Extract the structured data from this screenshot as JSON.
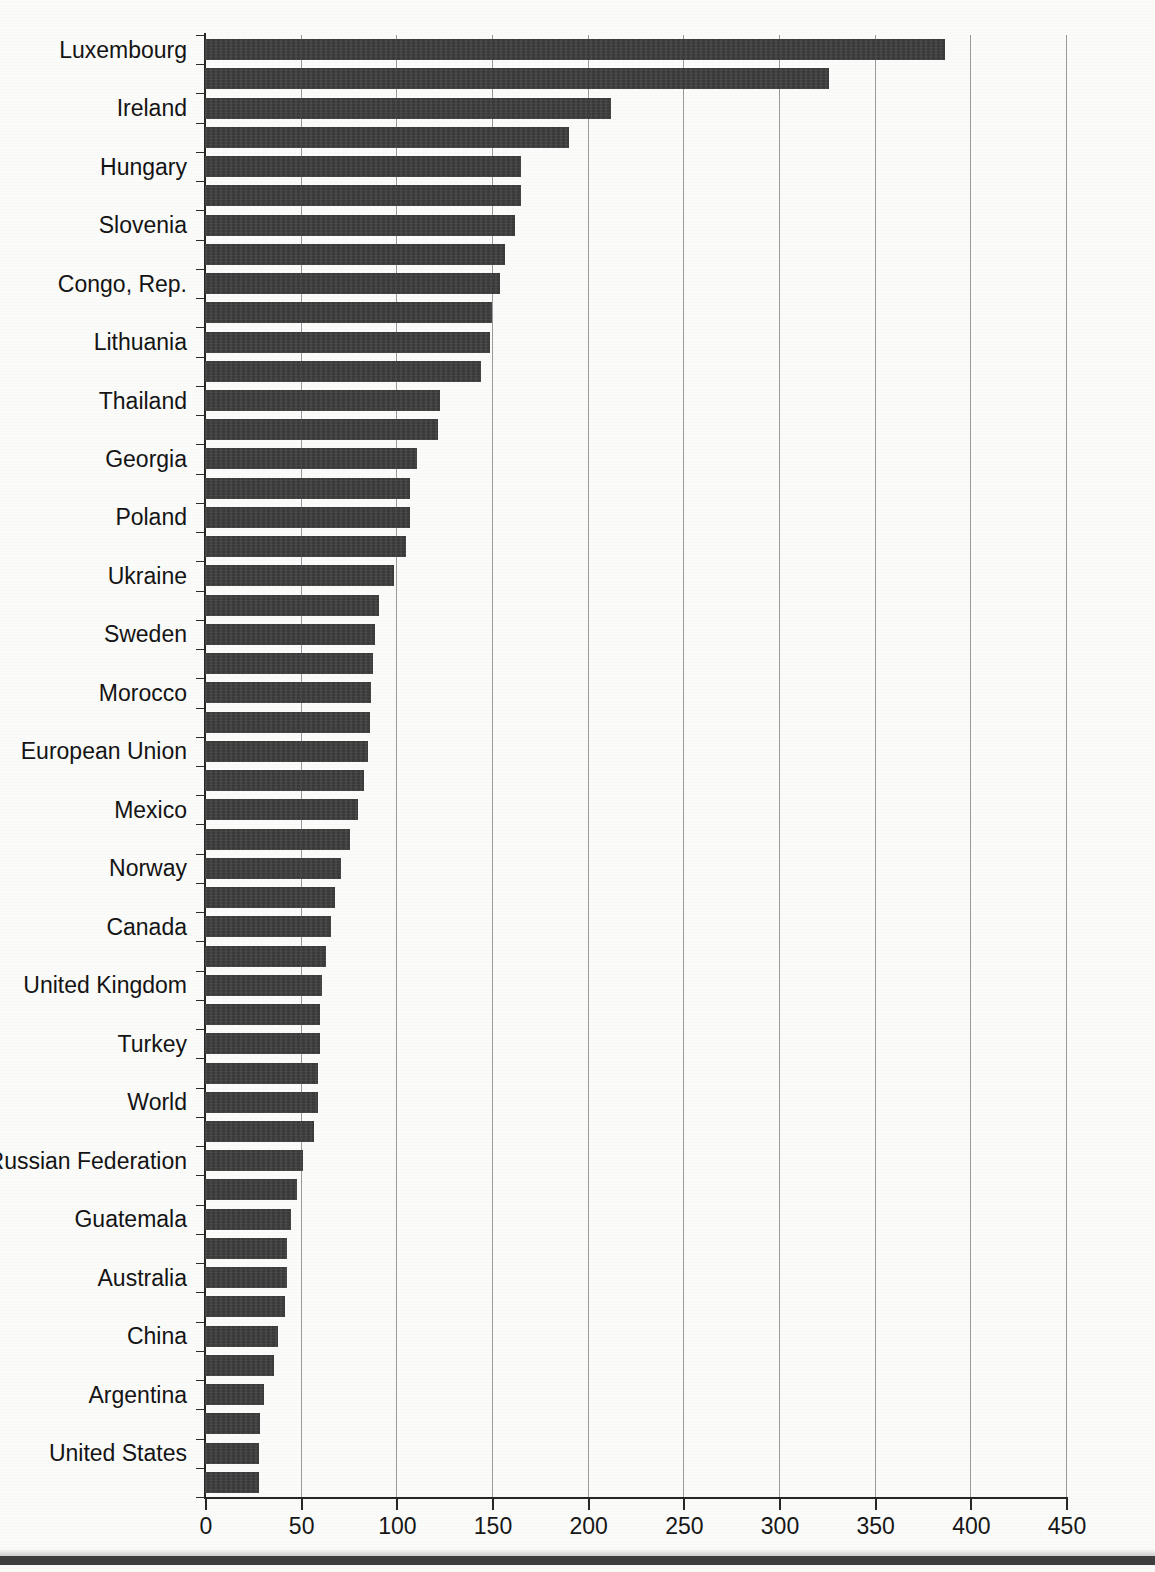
{
  "page": {
    "clipped_title": "",
    "background_color": "#fbfbfa",
    "bar_color": "#3a3a3a",
    "axis_color": "#262626",
    "grid_color": "#9a9a9a"
  },
  "axis": {
    "x_ticks": [
      "0",
      "50",
      "100",
      "150",
      "200",
      "250",
      "300",
      "350",
      "400",
      "450"
    ],
    "x_min": 0,
    "x_max": 450,
    "x_step": 50
  },
  "chart_data": {
    "type": "bar",
    "orientation": "horizontal",
    "title": "",
    "subtitle": "",
    "xlabel": "",
    "ylabel": "",
    "xlim": [
      0,
      450
    ],
    "ylim": null,
    "grid": "vertical-only",
    "legend": "none",
    "tick_labels_every_n_bars": 2,
    "categories": [
      "Luxembourg",
      "",
      "Ireland",
      "",
      "Hungary",
      "",
      "Slovenia",
      "",
      "Congo, Rep.",
      "",
      "Lithuania",
      "",
      "Thailand",
      "",
      "Georgia",
      "",
      "Poland",
      "",
      "Ukraine",
      "",
      "Sweden",
      "",
      "Morocco",
      "",
      "European Union",
      "",
      "Mexico",
      "",
      "Norway",
      "",
      "Canada",
      "",
      "United Kingdom",
      "",
      "Turkey",
      "",
      "World",
      "",
      "Russian Federation",
      "",
      "Guatemala",
      "",
      "Australia",
      "",
      "China",
      "",
      "Argentina",
      "",
      "United States",
      ""
    ],
    "labeled_categories": [
      "Luxembourg",
      "Ireland",
      "Hungary",
      "Slovenia",
      "Congo, Rep.",
      "Lithuania",
      "Thailand",
      "Georgia",
      "Poland",
      "Ukraine",
      "Sweden",
      "Morocco",
      "European Union",
      "Mexico",
      "Norway",
      "Canada",
      "United Kingdom",
      "Turkey",
      "World",
      "Russian Federation",
      "Guatemala",
      "Australia",
      "China",
      "Argentina",
      "United States"
    ],
    "values": [
      387,
      326,
      212,
      190,
      165,
      165,
      162,
      157,
      154,
      150,
      149,
      144,
      123,
      122,
      111,
      107,
      107,
      105,
      99,
      91,
      89,
      88,
      87,
      86,
      85,
      83,
      80,
      76,
      71,
      68,
      66,
      63,
      61,
      60,
      60,
      59,
      59,
      57,
      51,
      48,
      45,
      43,
      43,
      42,
      38,
      36,
      31,
      29,
      28,
      28
    ],
    "xtick_positions": [
      0,
      50,
      100,
      150,
      200,
      250,
      300,
      350,
      400,
      450
    ],
    "bar_count": 50
  }
}
